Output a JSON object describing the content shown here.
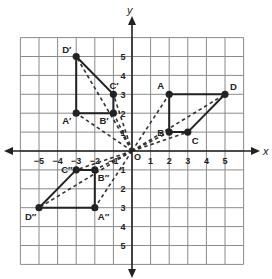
{
  "diagram": {
    "type": "coordinate-plane-transformations",
    "axes": {
      "x_label": "x",
      "y_label": "y",
      "origin_label": "O",
      "x_ticks": [
        -5,
        -4,
        -3,
        -2,
        -1,
        1,
        2,
        3,
        4,
        5
      ],
      "y_ticks": [
        -5,
        -4,
        -3,
        -2,
        -1,
        1,
        2,
        3,
        4,
        5
      ],
      "x_tick_labels": [
        "−5",
        "−4",
        "−3",
        "−2",
        "−1",
        "1",
        "2",
        "3",
        "4",
        "5"
      ],
      "y_tick_labels": [
        "5",
        "4",
        "3",
        "2",
        "1",
        "1",
        "2",
        "3",
        "4",
        "5"
      ],
      "grid_range": [
        -6,
        6
      ]
    },
    "figures": [
      {
        "name": "ABCD",
        "vertices": [
          {
            "label": "A",
            "x": 2,
            "y": 3,
            "label_dx": -12,
            "label_dy": -5
          },
          {
            "label": "B",
            "x": 2,
            "y": 1,
            "label_dx": -12,
            "label_dy": 4
          },
          {
            "label": "C",
            "x": 3,
            "y": 1,
            "label_dx": 4,
            "label_dy": 12
          },
          {
            "label": "D",
            "x": 5,
            "y": 3,
            "label_dx": 5,
            "label_dy": -4
          }
        ]
      },
      {
        "name": "A'B'C'D'",
        "vertices": [
          {
            "label": "A′",
            "x": -3,
            "y": 2,
            "label_dx": -14,
            "label_dy": 11
          },
          {
            "label": "B′",
            "x": -1,
            "y": 2,
            "label_dx": -14,
            "label_dy": 11
          },
          {
            "label": "C′",
            "x": -1,
            "y": 3,
            "label_dx": -4,
            "label_dy": -5
          },
          {
            "label": "D′",
            "x": -3,
            "y": 5,
            "label_dx": -14,
            "label_dy": -4
          }
        ]
      },
      {
        "name": "A''B''C''D''",
        "vertices": [
          {
            "label": "A″",
            "x": -2,
            "y": -3,
            "label_dx": 3,
            "label_dy": 12
          },
          {
            "label": "B″",
            "x": -2,
            "y": -1,
            "label_dx": 3,
            "label_dy": 11
          },
          {
            "label": "C″",
            "x": -3,
            "y": -1,
            "label_dx": -15,
            "label_dy": 3
          },
          {
            "label": "D″",
            "x": -5,
            "y": -3,
            "label_dx": -14,
            "label_dy": 12
          }
        ]
      }
    ],
    "colors": {
      "grid": "#8a8a8a",
      "axis": "#222222",
      "figure": "#222222",
      "dashed": "#333333"
    }
  }
}
